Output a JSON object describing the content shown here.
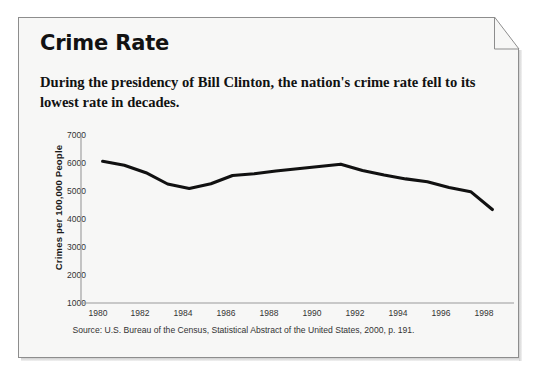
{
  "card": {
    "title": "Crime Rate",
    "subtitle": "During the presidency of Bill Clinton, the nation's crime rate fell to its lowest rate in decades.",
    "source": "Source: U.S. Bureau of the Census, Statistical Abstract of the United States, 2000, p. 191.",
    "fold_corner": "page-fold-corner"
  },
  "colors": {
    "line": "#111111",
    "axis": "#999999",
    "text": "#121212",
    "card_bg": "#f7f7f6",
    "border": "#8d8d8d"
  },
  "chart_data": {
    "type": "line",
    "title": "Crime Rate",
    "subtitle": "During the presidency of Bill Clinton, the nation's crime rate fell to its lowest rate in decades.",
    "xlabel": "",
    "ylabel": "Crimes per 100,000 People",
    "xlim": [
      1979,
      1999
    ],
    "ylim": [
      1000,
      7000
    ],
    "grid": false,
    "legend": null,
    "source": "Source: U.S. Bureau of the Census, Statistical Abstract of the United States, 2000, p. 191.",
    "ytick_labels": [
      "7000",
      "6000",
      "5000",
      "4000",
      "3000",
      "2000",
      "1000"
    ],
    "yticks": [
      7000,
      6000,
      5000,
      4000,
      3000,
      2000,
      1000
    ],
    "xtick_labels": [
      "1980",
      "1982",
      "1984",
      "1986",
      "1988",
      "1990",
      "1992",
      "1994",
      "1996",
      "1998"
    ],
    "xticks": [
      1980,
      1982,
      1984,
      1986,
      1988,
      1990,
      1992,
      1994,
      1996,
      1998
    ],
    "series": [
      {
        "name": "Crimes per 100,000 People",
        "x": [
          1980,
          1981,
          1982,
          1983,
          1984,
          1985,
          1986,
          1987,
          1988,
          1989,
          1990,
          1991,
          1992,
          1993,
          1994,
          1995,
          1996,
          1997,
          1998
        ],
        "values": [
          6000,
          5860,
          5600,
          5200,
          5040,
          5210,
          5500,
          5560,
          5660,
          5740,
          5820,
          5900,
          5680,
          5520,
          5380,
          5280,
          5080,
          4930,
          4300
        ]
      }
    ]
  }
}
